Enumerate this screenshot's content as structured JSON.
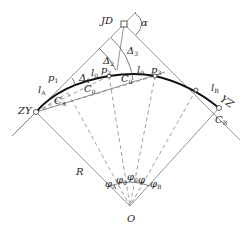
{
  "diagram": {
    "points": {
      "JD": {
        "label": "JD",
        "x": 124,
        "y": 24
      },
      "ZY": {
        "label": "ZY",
        "x": 36,
        "y": 112
      },
      "YZ": {
        "label": "YZ",
        "x": 219,
        "y": 108
      },
      "O": {
        "label": "O",
        "x": 130,
        "y": 212
      },
      "p2": {
        "label": "p",
        "sub": "2",
        "x": 109,
        "y": 76
      },
      "p3": {
        "label": "p",
        "sub": "3",
        "x": 155,
        "y": 76
      },
      "CB": {
        "label": "C",
        "sub": "B",
        "x": 219,
        "y": 108
      }
    },
    "labels": {
      "alpha": "α",
      "delta1": {
        "main": "Δ",
        "sub": "1"
      },
      "delta2": {
        "main": "Δ",
        "sub": "2"
      },
      "delta3": {
        "main": "Δ",
        "sub": "3"
      },
      "p1": {
        "main": "p",
        "sub": "1"
      },
      "p2": {
        "main": "p",
        "sub": "2"
      },
      "p3": {
        "main": "p",
        "sub": "3"
      },
      "lA": {
        "main": "l",
        "sub": "A"
      },
      "l0_left": {
        "main": "l",
        "sub": "0"
      },
      "l0_right": {
        "main": "l",
        "sub": "0"
      },
      "lB": {
        "main": "l",
        "sub": "B"
      },
      "CA": {
        "main": "C",
        "sub": "A"
      },
      "C0_lower": {
        "main": "C",
        "sub": "0"
      },
      "C0_upper": {
        "main": "C",
        "sub": "0"
      },
      "CB": {
        "main": "C",
        "sub": "B"
      },
      "R": "R",
      "O": "O",
      "JD": "JD",
      "ZY": "ZY",
      "YZ": "YZ",
      "phiA": {
        "main": "φ",
        "sub": "A"
      },
      "phi0_a": {
        "main": "φ",
        "sub": "0"
      },
      "phi0_b": {
        "main": "φ",
        "sub": "0"
      },
      "phi": {
        "main": "φ",
        "sub": ""
      },
      "phiB": {
        "main": "φ",
        "sub": "B"
      }
    }
  }
}
